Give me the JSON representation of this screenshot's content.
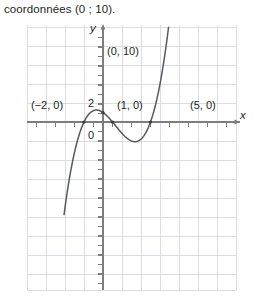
{
  "caption": {
    "text": "coordonnées (0 ; 10)."
  },
  "figure": {
    "name": "cubic-graph",
    "axis_labels": {
      "x": "x",
      "y": "y"
    },
    "tick_labels": {
      "zero": "0",
      "two": "2"
    },
    "point_labels": [
      {
        "id": "root-left",
        "text": "(−2, 0)",
        "x": -2,
        "y": 0
      },
      {
        "id": "y-intercept",
        "text": "(0, 10)",
        "x": 0,
        "y": 10
      },
      {
        "id": "root-mid",
        "text": "(1, 0)",
        "x": 1,
        "y": 0
      },
      {
        "id": "root-right",
        "text": "(5, 0)",
        "x": 5,
        "y": 0
      }
    ],
    "colors": {
      "grid": "#d9dde3",
      "axis": "#6f6f6f",
      "curve": "#58595b",
      "text": "#231f20",
      "background": "#ffffff"
    }
  },
  "chart_data": {
    "type": "line",
    "title": "",
    "xlabel": "x",
    "ylabel": "y",
    "grid": true,
    "legend": null,
    "xlim": [
      -4.1,
      7.1
    ],
    "ylim": [
      -18.2,
      13.0
    ],
    "xticks": [
      -4,
      -3,
      -2,
      -1,
      0,
      1,
      2,
      3,
      4,
      5,
      6,
      7
    ],
    "yticks": [
      0,
      2
    ],
    "annotations": [
      {
        "label": "(−2, 0)",
        "x": -2,
        "y": 0
      },
      {
        "label": "(0, 10)",
        "x": 0,
        "y": 10
      },
      {
        "label": "(1, 0)",
        "x": 1,
        "y": 0
      },
      {
        "label": "(5, 0)",
        "x": 5,
        "y": 0
      }
    ],
    "series": [
      {
        "name": "f(x) = (x+2)(x-1)(x-5)",
        "roots": [
          -2,
          1,
          5
        ],
        "y_intercept": 10,
        "local_max": {
          "x": -0.52,
          "y": 12.6
        },
        "local_min": {
          "x": 3.19,
          "y": -17.0
        },
        "x": [
          -3.2,
          -3.0,
          -2.8,
          -2.6,
          -2.4,
          -2.2,
          -2.0,
          -1.8,
          -1.6,
          -1.4,
          -1.2,
          -1.0,
          -0.8,
          -0.6,
          -0.4,
          -0.2,
          0.0,
          0.2,
          0.4,
          0.6,
          0.8,
          1.0,
          1.2,
          1.4,
          1.6,
          1.8,
          2.0,
          2.2,
          2.4,
          2.6,
          2.8,
          3.0,
          3.2,
          3.4,
          3.6,
          3.8,
          4.0,
          4.2,
          4.4,
          4.6,
          4.8,
          5.0,
          5.2,
          5.4,
          5.6,
          5.8,
          6.0
        ],
        "y": [
          -41.47,
          -32.0,
          -23.33,
          -15.46,
          -8.36,
          -2.02,
          0.0,
          4.56,
          8.45,
          11.66,
          12.62,
          12.0,
          11.31,
          11.7,
          12.1,
          11.99,
          10.0,
          9.5,
          8.39,
          6.18,
          3.66,
          0.0,
          -3.17,
          -6.34,
          -9.46,
          -12.48,
          -15.0,
          -17.06,
          -18.62,
          -19.63,
          -20.06,
          -20.0,
          -18.82,
          -16.85,
          -14.06,
          -10.41,
          -6.0,
          -0.69,
          5.56,
          12.81,
          21.1,
          30.0,
          40.3,
          51.3,
          63.16,
          75.95,
          90.0
        ]
      }
    ]
  }
}
